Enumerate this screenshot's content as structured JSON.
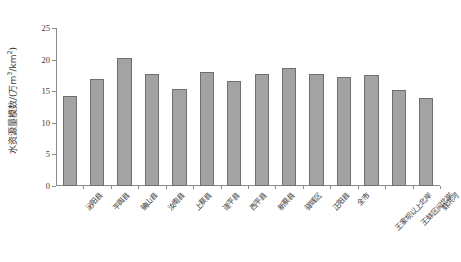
{
  "chart_data": {
    "type": "bar",
    "title": "",
    "xlabel": "",
    "ylabel": "水资源量模数/(万m3/km2)",
    "ylabel_parts": {
      "main": "水资源量模数/(万m",
      "sup1": "3",
      "mid": "/km",
      "sup2": "2",
      "tail": ")"
    },
    "ylim": [
      0,
      25
    ],
    "yticks": [
      0,
      5,
      10,
      15,
      20,
      25
    ],
    "ytick_labels": [
      "0",
      "5",
      "10",
      "15",
      "20",
      "25"
    ],
    "grid": false,
    "legend": "none",
    "bar_color": "#a3a3a3",
    "bar_edge_color": "#6f6f6f",
    "axis_color": "#8a8a8a",
    "categories": [
      "泌阳县",
      "平舆县",
      "确山县",
      "汝南县",
      "上蔡县",
      "遂平县",
      "西平县",
      "新蔡县",
      "驿城区",
      "正阳县",
      "全市",
      "王家坝以上北岸",
      "王蚌区间北岸",
      "蚌洪河"
    ],
    "values": [
      14.2,
      16.9,
      20.2,
      17.7,
      15.4,
      18.0,
      16.6,
      17.65,
      18.7,
      17.8,
      17.25,
      17.5,
      15.2,
      14.0
    ]
  }
}
